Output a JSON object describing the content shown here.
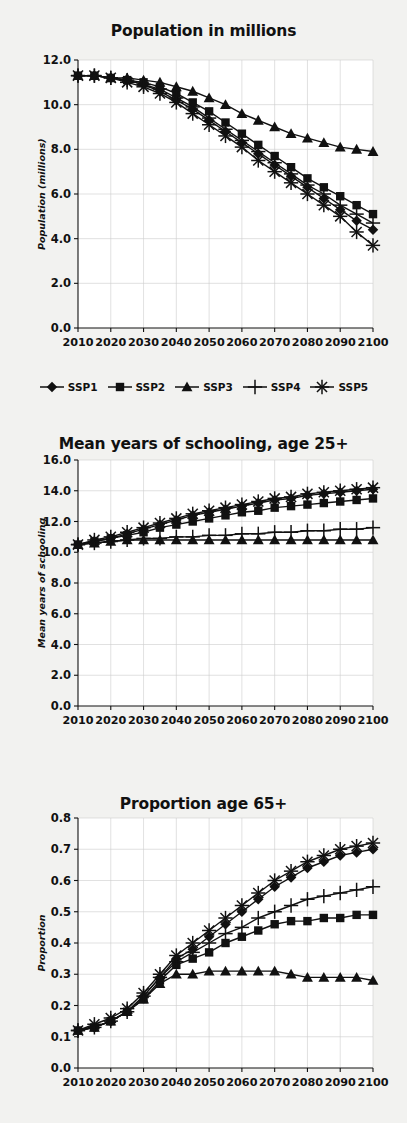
{
  "figure": {
    "background": "#f2f2f0",
    "plot_background": "#ffffff",
    "ink": "#111111",
    "grid_color": "#cccccc"
  },
  "legend": {
    "position": "below-first-panel",
    "entries": [
      {
        "label": "SSP1",
        "marker": "diamond"
      },
      {
        "label": "SSP2",
        "marker": "square"
      },
      {
        "label": "SSP3",
        "marker": "triangle"
      },
      {
        "label": "SSP4",
        "marker": "plus"
      },
      {
        "label": "SSP5",
        "marker": "asterisk"
      }
    ]
  },
  "chart_data": [
    {
      "id": "population",
      "type": "line",
      "title": "Population in millions",
      "xlabel": "",
      "ylabel": "Population (millions)",
      "grid": true,
      "legend_position": "bottom",
      "x": [
        2010,
        2015,
        2020,
        2025,
        2030,
        2035,
        2040,
        2045,
        2050,
        2055,
        2060,
        2065,
        2070,
        2075,
        2080,
        2085,
        2090,
        2095,
        2100
      ],
      "xticks": [
        2010,
        2020,
        2030,
        2040,
        2050,
        2060,
        2070,
        2080,
        2090,
        2100
      ],
      "yticks": [
        0.0,
        2.0,
        4.0,
        6.0,
        8.0,
        10.0,
        12.0
      ],
      "ylim": [
        0.0,
        12.0
      ],
      "xlim": [
        2010,
        2100
      ],
      "series": [
        {
          "name": "SSP1",
          "marker": "diamond",
          "values": [
            11.3,
            11.3,
            11.2,
            11.1,
            10.9,
            10.6,
            10.2,
            9.8,
            9.3,
            8.8,
            8.3,
            7.8,
            7.3,
            6.8,
            6.3,
            5.8,
            5.3,
            4.8,
            4.4
          ]
        },
        {
          "name": "SSP2",
          "marker": "square",
          "values": [
            11.3,
            11.3,
            11.2,
            11.1,
            11.0,
            10.8,
            10.5,
            10.1,
            9.7,
            9.2,
            8.7,
            8.2,
            7.7,
            7.2,
            6.7,
            6.3,
            5.9,
            5.5,
            5.1
          ]
        },
        {
          "name": "SSP3",
          "marker": "triangle",
          "values": [
            11.3,
            11.3,
            11.2,
            11.2,
            11.1,
            11.0,
            10.8,
            10.6,
            10.3,
            10.0,
            9.6,
            9.3,
            9.0,
            8.7,
            8.5,
            8.3,
            8.1,
            8.0,
            7.9
          ]
        },
        {
          "name": "SSP4",
          "marker": "plus",
          "values": [
            11.3,
            11.3,
            11.2,
            11.1,
            10.9,
            10.7,
            10.3,
            9.9,
            9.4,
            8.9,
            8.4,
            7.9,
            7.4,
            6.9,
            6.4,
            6.0,
            5.5,
            5.1,
            4.7
          ]
        },
        {
          "name": "SSP5",
          "marker": "asterisk",
          "values": [
            11.3,
            11.3,
            11.2,
            11.0,
            10.8,
            10.5,
            10.1,
            9.6,
            9.1,
            8.6,
            8.1,
            7.5,
            7.0,
            6.5,
            6.0,
            5.5,
            5.0,
            4.3,
            3.7
          ]
        }
      ]
    },
    {
      "id": "schooling",
      "type": "line",
      "title": "Mean years of schooling, age 25+",
      "xlabel": "",
      "ylabel": "Mean years of schooling",
      "grid": true,
      "x": [
        2010,
        2015,
        2020,
        2025,
        2030,
        2035,
        2040,
        2045,
        2050,
        2055,
        2060,
        2065,
        2070,
        2075,
        2080,
        2085,
        2090,
        2095,
        2100
      ],
      "xticks": [
        2010,
        2020,
        2030,
        2040,
        2050,
        2060,
        2070,
        2080,
        2090,
        2100
      ],
      "yticks": [
        0.0,
        2.0,
        4.0,
        6.0,
        8.0,
        10.0,
        12.0,
        14.0,
        16.0
      ],
      "ylim": [
        0.0,
        16.0
      ],
      "xlim": [
        2010,
        2100
      ],
      "series": [
        {
          "name": "SSP1",
          "marker": "diamond",
          "values": [
            10.5,
            10.7,
            10.9,
            11.2,
            11.5,
            11.8,
            12.1,
            12.4,
            12.6,
            12.8,
            13.0,
            13.2,
            13.4,
            13.5,
            13.7,
            13.8,
            13.9,
            14.0,
            14.1
          ]
        },
        {
          "name": "SSP2",
          "marker": "square",
          "values": [
            10.5,
            10.7,
            10.9,
            11.1,
            11.3,
            11.6,
            11.8,
            12.0,
            12.2,
            12.4,
            12.6,
            12.7,
            12.9,
            13.0,
            13.1,
            13.2,
            13.3,
            13.4,
            13.5
          ]
        },
        {
          "name": "SSP3",
          "marker": "triangle",
          "values": [
            10.5,
            10.6,
            10.7,
            10.8,
            10.8,
            10.8,
            10.8,
            10.8,
            10.8,
            10.8,
            10.8,
            10.8,
            10.8,
            10.8,
            10.8,
            10.8,
            10.8,
            10.8,
            10.8
          ]
        },
        {
          "name": "SSP4",
          "marker": "plus",
          "values": [
            10.5,
            10.6,
            10.7,
            10.8,
            10.9,
            10.9,
            11.0,
            11.0,
            11.1,
            11.1,
            11.2,
            11.2,
            11.3,
            11.3,
            11.4,
            11.4,
            11.5,
            11.5,
            11.6
          ]
        },
        {
          "name": "SSP5",
          "marker": "asterisk",
          "values": [
            10.5,
            10.8,
            11.0,
            11.3,
            11.6,
            11.9,
            12.2,
            12.5,
            12.7,
            12.9,
            13.1,
            13.3,
            13.5,
            13.6,
            13.8,
            13.9,
            14.0,
            14.1,
            14.2
          ]
        }
      ]
    },
    {
      "id": "proportion65",
      "type": "line",
      "title": "Proportion age 65+",
      "xlabel": "",
      "ylabel": "Proportion",
      "grid": true,
      "x": [
        2010,
        2015,
        2020,
        2025,
        2030,
        2035,
        2040,
        2045,
        2050,
        2055,
        2060,
        2065,
        2070,
        2075,
        2080,
        2085,
        2090,
        2095,
        2100
      ],
      "xticks": [
        2010,
        2020,
        2030,
        2040,
        2050,
        2060,
        2070,
        2080,
        2090,
        2100
      ],
      "yticks": [
        0.0,
        0.1,
        0.2,
        0.3,
        0.4,
        0.5,
        0.6,
        0.7,
        0.8
      ],
      "ylim": [
        0.0,
        0.8
      ],
      "xlim": [
        2010,
        2100
      ],
      "series": [
        {
          "name": "SSP1",
          "marker": "diamond",
          "values": [
            0.12,
            0.13,
            0.15,
            0.18,
            0.23,
            0.29,
            0.35,
            0.38,
            0.42,
            0.46,
            0.5,
            0.54,
            0.58,
            0.61,
            0.64,
            0.66,
            0.68,
            0.69,
            0.7
          ]
        },
        {
          "name": "SSP2",
          "marker": "square",
          "values": [
            0.12,
            0.13,
            0.15,
            0.18,
            0.22,
            0.28,
            0.33,
            0.35,
            0.37,
            0.4,
            0.42,
            0.44,
            0.46,
            0.47,
            0.47,
            0.48,
            0.48,
            0.49,
            0.49
          ]
        },
        {
          "name": "SSP3",
          "marker": "triangle",
          "values": [
            0.12,
            0.13,
            0.15,
            0.18,
            0.22,
            0.27,
            0.3,
            0.3,
            0.31,
            0.31,
            0.31,
            0.31,
            0.31,
            0.3,
            0.29,
            0.29,
            0.29,
            0.29,
            0.28
          ]
        },
        {
          "name": "SSP4",
          "marker": "plus",
          "values": [
            0.12,
            0.13,
            0.15,
            0.18,
            0.23,
            0.29,
            0.34,
            0.37,
            0.4,
            0.43,
            0.45,
            0.48,
            0.5,
            0.52,
            0.54,
            0.55,
            0.56,
            0.57,
            0.58
          ]
        },
        {
          "name": "SSP5",
          "marker": "asterisk",
          "values": [
            0.12,
            0.14,
            0.16,
            0.19,
            0.24,
            0.3,
            0.36,
            0.4,
            0.44,
            0.48,
            0.52,
            0.56,
            0.6,
            0.63,
            0.66,
            0.68,
            0.7,
            0.71,
            0.72
          ]
        }
      ]
    }
  ]
}
